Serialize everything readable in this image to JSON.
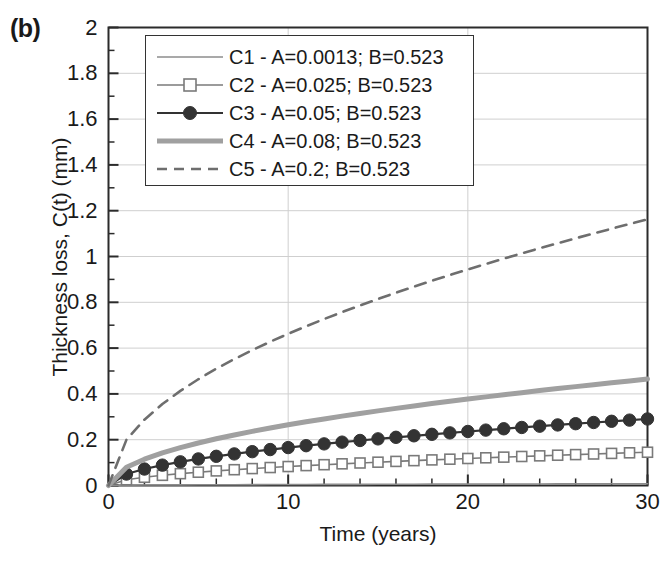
{
  "panel": {
    "label": "(b)"
  },
  "chart_data": {
    "type": "line",
    "title": "",
    "xlabel": "Time (years)",
    "ylabel": "Thickness loss, C(t) (mm)",
    "xlim": [
      0,
      30
    ],
    "ylim": [
      0,
      2
    ],
    "xticks": [
      0,
      10,
      20,
      30
    ],
    "xtick_labels": [
      "0",
      "10",
      "20",
      "30"
    ],
    "x_minor_tick_step": 2,
    "yticks": [
      0,
      0.2,
      0.4,
      0.6,
      0.8,
      1,
      1.2,
      1.4,
      1.6,
      1.8,
      2
    ],
    "ytick_labels": [
      "0",
      "0.2",
      "0.4",
      "0.6",
      "0.8",
      "1",
      "1.2",
      "1.4",
      "1.6",
      "1.8",
      "2"
    ],
    "y_minor_tick_step": 0.1,
    "grid": {
      "horizontal": true,
      "vertical": true
    },
    "legend_position": "upper-left-inside",
    "model": "C(t) = A * t^B",
    "x": [
      0,
      1,
      2,
      3,
      4,
      5,
      6,
      7,
      8,
      9,
      10,
      11,
      12,
      13,
      14,
      15,
      16,
      17,
      18,
      19,
      20,
      21,
      22,
      23,
      24,
      25,
      26,
      27,
      28,
      29,
      30
    ],
    "series": [
      {
        "name": "C1 - A=0.0013; B=0.523",
        "label": "C1 - A=0.0013; B=0.523",
        "A": 0.0013,
        "B": 0.523,
        "color": "#8c8c8c",
        "linewidth": 1.6,
        "linestyle": "solid",
        "marker": "none",
        "values": [
          0,
          0.0013,
          0.00187,
          0.00231,
          0.00268,
          0.00301,
          0.00331,
          0.00358,
          0.00384,
          0.00408,
          0.00431,
          0.00452,
          0.00473,
          0.00493,
          0.00512,
          0.00531,
          0.00549,
          0.00566,
          0.00583,
          0.006,
          0.00616,
          0.00632,
          0.00647,
          0.00662,
          0.00677,
          0.00691,
          0.00705,
          0.00719,
          0.00733,
          0.00746,
          0.0076
        ]
      },
      {
        "name": "C2 - A=0.025; B=0.523",
        "label": "C2 - A=0.025; B=0.523",
        "A": 0.025,
        "B": 0.523,
        "color": "#7a7a7a",
        "linewidth": 1.6,
        "linestyle": "solid",
        "marker": "open-square",
        "values": [
          0,
          0.025,
          0.03594,
          0.04447,
          0.05167,
          0.05801,
          0.06373,
          0.06898,
          0.07387,
          0.07846,
          0.08279,
          0.08692,
          0.09086,
          0.09465,
          0.0983,
          0.10182,
          0.10523,
          0.10854,
          0.11176,
          0.11489,
          0.11795,
          0.12093,
          0.12385,
          0.12671,
          0.1295,
          0.13225,
          0.13494,
          0.13758,
          0.14018,
          0.14273,
          0.14525
        ]
      },
      {
        "name": "C3 - A=0.05; B=0.523",
        "label": "C3 - A=0.05; B=0.523",
        "A": 0.05,
        "B": 0.523,
        "color": "#333333",
        "linewidth": 2.2,
        "linestyle": "solid",
        "marker": "filled-circle",
        "values": [
          0,
          0.05,
          0.07188,
          0.08894,
          0.10334,
          0.11602,
          0.12746,
          0.13796,
          0.14773,
          0.15691,
          0.16559,
          0.17384,
          0.18172,
          0.18929,
          0.19659,
          0.20363,
          0.21046,
          0.21708,
          0.22352,
          0.22979,
          0.2359,
          0.24187,
          0.2477,
          0.25341,
          0.25901,
          0.26449,
          0.26988,
          0.27517,
          0.28036,
          0.28547,
          0.2905
        ]
      },
      {
        "name": "C4 - A=0.08; B=0.523",
        "label": "C4 - A=0.08; B=0.523",
        "A": 0.08,
        "B": 0.523,
        "color": "#a0a0a0",
        "linewidth": 5.0,
        "linestyle": "solid",
        "marker": "none",
        "values": [
          0,
          0.08,
          0.11501,
          0.1423,
          0.16534,
          0.18563,
          0.20394,
          0.22074,
          0.23636,
          0.25106,
          0.26495,
          0.27815,
          0.29075,
          0.30286,
          0.31455,
          0.32581,
          0.33674,
          0.34733,
          0.35763,
          0.36767,
          0.37744,
          0.38699,
          0.39632,
          0.40546,
          0.41441,
          0.42319,
          0.43181,
          0.44027,
          0.44858,
          0.45676,
          0.4648
        ]
      },
      {
        "name": "C5 - A=0.2; B=0.523",
        "label": "C5 - A=0.2; B=0.523",
        "A": 0.2,
        "B": 0.523,
        "color": "#6e6e6e",
        "linewidth": 2.6,
        "linestyle": "dashed",
        "marker": "none",
        "values": [
          0,
          0.2,
          0.28753,
          0.35575,
          0.41336,
          0.46408,
          0.50985,
          0.55186,
          0.59089,
          0.62766,
          0.66238,
          0.69537,
          0.72688,
          0.75715,
          0.78637,
          0.81453,
          0.84185,
          0.86833,
          0.89407,
          0.91917,
          0.94359,
          0.96747,
          0.9908,
          1.01364,
          1.03603,
          1.05798,
          1.07953,
          1.10068,
          1.12146,
          1.14189,
          1.162
        ]
      }
    ]
  },
  "axis_colors": {
    "frame": "#2b2b2b",
    "grid": "#cfcfcf",
    "text": "#1a1a1a"
  }
}
